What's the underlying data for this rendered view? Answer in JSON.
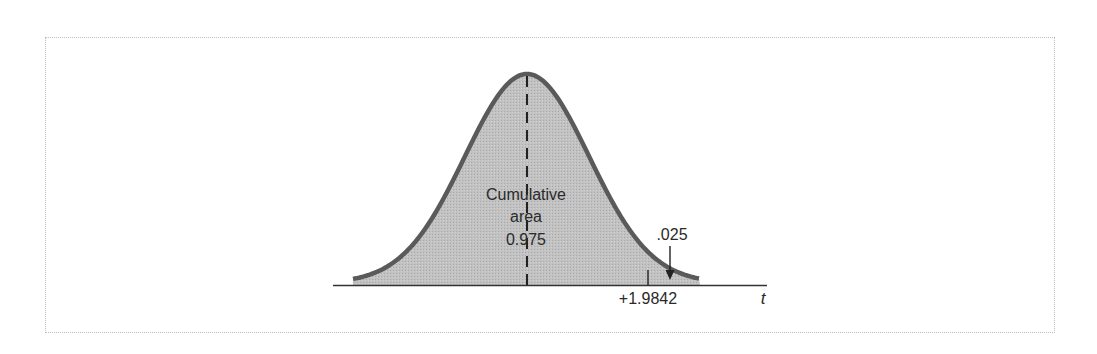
{
  "chart_data": {
    "type": "area",
    "title": "",
    "distribution": "Student t (approx. normal shape)",
    "xlabel": "t",
    "ylabel": "",
    "critical_value": 1.9842,
    "critical_value_label": "+1.9842",
    "cumulative_area": 0.975,
    "tail_area": 0.025,
    "annotations": {
      "center_line_1": "Cumulative",
      "center_line_2": "area",
      "center_line_3": "0.975",
      "tail_label": ".025"
    },
    "grid": false,
    "legend": "none",
    "shaded_region": "entire area under curve (mid-gray)",
    "mean_marker": "dashed vertical line at t = 0"
  },
  "figure": {
    "axis_label": "t",
    "critical_label": "+1.9842",
    "tail_label": ".025",
    "center_label_1": "Cumulative",
    "center_label_2": "area",
    "center_label_3": "0.975"
  },
  "colors": {
    "fill": "#bdbdbd",
    "curve": "#5a5a5a",
    "axis": "#333333",
    "text": "#2a2a2a",
    "frame": "#bdbdbd"
  }
}
